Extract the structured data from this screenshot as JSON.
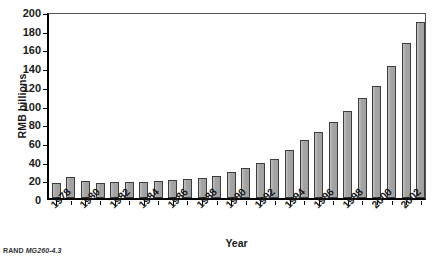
{
  "chart_data": {
    "type": "bar",
    "title": "",
    "xlabel": "Year",
    "ylabel": "RMB billions",
    "ylim": [
      0,
      200
    ],
    "ytick_step": 20,
    "yticks": [
      "0",
      "20",
      "40",
      "60",
      "80",
      "100",
      "120",
      "140",
      "160",
      "180",
      "200"
    ],
    "grid": false,
    "legend": null,
    "categories": [
      "1978",
      "1979",
      "1980",
      "1981",
      "1982",
      "1983",
      "1984",
      "1985",
      "1986",
      "1987",
      "1988",
      "1989",
      "1990",
      "1991",
      "1992",
      "1993",
      "1994",
      "1995",
      "1996",
      "1997",
      "1998",
      "1999",
      "2000",
      "2001",
      "2002",
      "2003"
    ],
    "tick_labels_shown": [
      "1978",
      "1980",
      "1982",
      "1984",
      "1986",
      "1988",
      "1990",
      "1992",
      "1994",
      "1996",
      "1998",
      "2000",
      "2002"
    ],
    "values": [
      16,
      22,
      18,
      16,
      17,
      17,
      17,
      18,
      19,
      20,
      21,
      24,
      28,
      32,
      37,
      42,
      51,
      62,
      71,
      81,
      93,
      107,
      120,
      141,
      166,
      188
    ],
    "bar_fill": "#a9a9a9",
    "bar_edge": "#3d3d3d",
    "axis_color": "#000000"
  },
  "caption": {
    "source": "RAND",
    "figure_id": "MG260-4.3"
  }
}
